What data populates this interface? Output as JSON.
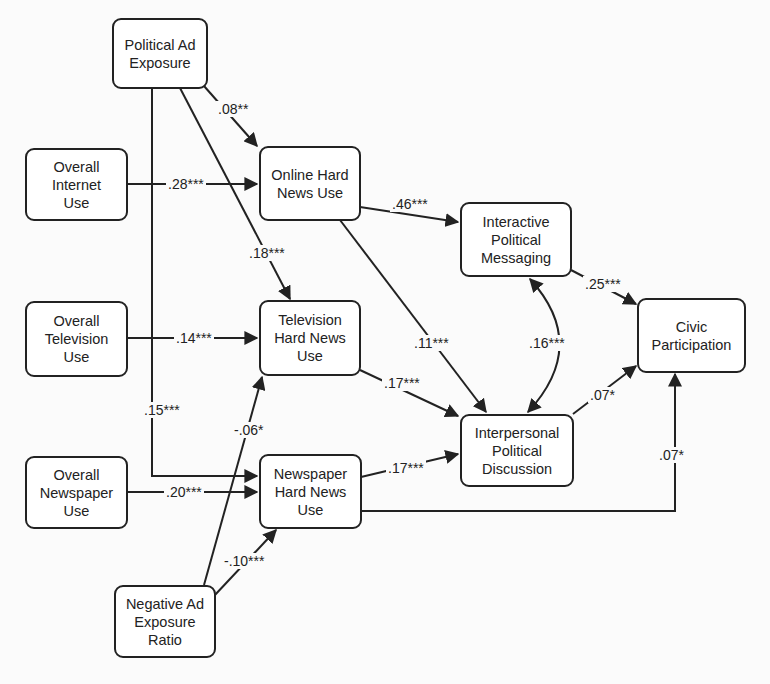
{
  "diagram": {
    "type": "path-model",
    "nodes": {
      "political_ad_exposure": "Political Ad\nExposure",
      "overall_internet_use": "Overall\nInternet\nUse",
      "online_hard_news_use": "Online Hard\nNews Use",
      "interactive_political_messaging": "Interactive\nPolitical\nMessaging",
      "civic_participation": "Civic\nParticipation",
      "overall_television_use": "Overall\nTelevision\nUse",
      "television_hard_news_use": "Television\nHard News\nUse",
      "interpersonal_political_discussion": "Interpersonal\nPolitical\nDiscussion",
      "overall_newspaper_use": "Overall\nNewspaper\nUse",
      "newspaper_hard_news_use": "Newspaper\nHard News\nUse",
      "negative_ad_exposure_ratio": "Negative Ad\nExposure\nRatio"
    },
    "edges": [
      {
        "from": "Political Ad Exposure",
        "to": "Online Hard News Use",
        "label": ".08**"
      },
      {
        "from": "Political Ad Exposure",
        "to": "Television Hard News Use",
        "label": ".18***"
      },
      {
        "from": "Political Ad Exposure",
        "to": "Newspaper Hard News Use",
        "label": ".15***"
      },
      {
        "from": "Overall Internet Use",
        "to": "Online Hard News Use",
        "label": ".28***"
      },
      {
        "from": "Overall Television Use",
        "to": "Television Hard News Use",
        "label": ".14***"
      },
      {
        "from": "Overall Newspaper Use",
        "to": "Newspaper Hard News Use",
        "label": ".20***"
      },
      {
        "from": "Negative Ad Exposure Ratio",
        "to": "Television Hard News Use",
        "label": "-.06*"
      },
      {
        "from": "Negative Ad Exposure Ratio",
        "to": "Newspaper Hard News Use",
        "label": "-.10***"
      },
      {
        "from": "Online Hard News Use",
        "to": "Interactive Political Messaging",
        "label": ".46***"
      },
      {
        "from": "Online Hard News Use",
        "to": "Interpersonal Political Discussion",
        "label": ".11***"
      },
      {
        "from": "Television Hard News Use",
        "to": "Interpersonal Political Discussion",
        "label": ".17***"
      },
      {
        "from": "Newspaper Hard News Use",
        "to": "Interpersonal Political Discussion",
        "label": ".17***"
      },
      {
        "from": "Interactive Political Messaging",
        "to": "Interpersonal Political Discussion",
        "label": ".16***",
        "bidirectional": true
      },
      {
        "from": "Interactive Political Messaging",
        "to": "Civic Participation",
        "label": ".25***"
      },
      {
        "from": "Interpersonal Political Discussion",
        "to": "Civic Participation",
        "label": ".07*"
      },
      {
        "from": "Newspaper Hard News Use",
        "to": "Civic Participation",
        "label": ".07*"
      }
    ],
    "edge_labels": {
      "pae_online": ".08**",
      "pae_tv": ".18***",
      "pae_news": ".15***",
      "internet_online": ".28***",
      "tv_tv": ".14***",
      "news_news": ".20***",
      "neg_tv": "-.06*",
      "neg_news": "-.10***",
      "online_interactive": ".46***",
      "online_interpersonal": ".11***",
      "tv_interpersonal": ".17***",
      "news_interpersonal": ".17***",
      "interactive_interpersonal": ".16***",
      "interactive_civic": ".25***",
      "interpersonal_civic": ".07*",
      "news_civic": ".07*"
    },
    "colors": {
      "line": "#222222",
      "box_fill": "#ffffff",
      "background": "#fbfbfb"
    }
  }
}
